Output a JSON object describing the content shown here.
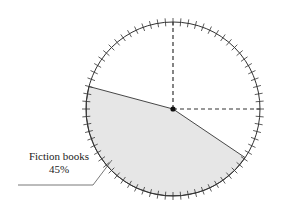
{
  "diagram": {
    "type": "pie-sector-diagram",
    "center": {
      "x": 173,
      "y": 109
    },
    "radius": 87,
    "tick_count": 72,
    "sector": {
      "label": "Fiction books",
      "percent": "45%",
      "value": 45,
      "start_angle_deg": 165,
      "end_angle_deg": 326,
      "fill": "#e6e6e6"
    },
    "dashed_radii": [
      "up",
      "right"
    ]
  },
  "colors": {
    "stroke": "#333333",
    "fill": "#e6e6e6"
  }
}
